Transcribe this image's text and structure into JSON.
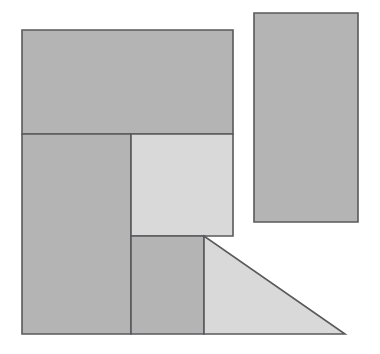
{
  "canvas": {
    "width": 380,
    "height": 354,
    "background_color": "#ffffff",
    "title": "Geometric dissection figure: rectangles and right triangle"
  },
  "palette": {
    "fill_dark": "#b4b4b4",
    "fill_light": "#d9d9d9",
    "stroke": "#59595c",
    "stroke_width": 1.6
  },
  "shapes": [
    {
      "id": "top-rectangle",
      "name": "top-rectangle",
      "type": "rect",
      "fill": "#b4b4b4",
      "stroke": "#59595c",
      "x": 22,
      "y": 30,
      "width": 211,
      "height": 104,
      "points": "22,30 233,30 233,134 22,134"
    },
    {
      "id": "left-tall-rectangle",
      "name": "left-tall-rectangle",
      "type": "rect",
      "fill": "#b4b4b4",
      "stroke": "#59595c",
      "x": 22,
      "y": 134,
      "width": 109,
      "height": 200,
      "points": "22,134 131,134 131,334 22,334"
    },
    {
      "id": "center-light-square",
      "name": "center-light-square",
      "type": "rect",
      "fill": "#d9d9d9",
      "stroke": "#59595c",
      "x": 131,
      "y": 134,
      "width": 102,
      "height": 102,
      "points": "131,134 233,134 233,236 131,236"
    },
    {
      "id": "lower-middle-rectangle",
      "name": "lower-middle-rectangle",
      "type": "rect",
      "fill": "#b4b4b4",
      "stroke": "#59595c",
      "x": 131,
      "y": 236,
      "width": 73,
      "height": 98,
      "points": "131,236 204,236 204,334 131,334"
    },
    {
      "id": "right-triangle",
      "name": "right-triangle",
      "type": "polygon",
      "fill": "#d9d9d9",
      "stroke": "#59595c",
      "points": "204,236 204,334 345,334",
      "vertices": [
        {
          "label": "apex",
          "x": 204,
          "y": 236
        },
        {
          "label": "bottom-left",
          "x": 204,
          "y": 334
        },
        {
          "label": "bottom-right",
          "x": 345,
          "y": 334
        }
      ]
    },
    {
      "id": "detached-right-rectangle",
      "name": "detached-right-rectangle",
      "type": "rect",
      "fill": "#b4b4b4",
      "stroke": "#59595c",
      "x": 254,
      "y": 13,
      "width": 104,
      "height": 209,
      "points": "254,13 358,13 358,222 254,222"
    }
  ],
  "labels": []
}
